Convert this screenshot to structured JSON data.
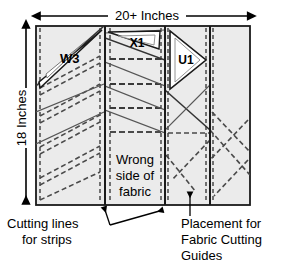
{
  "figure": {
    "kind": "fabric-cutting-layout-diagram",
    "fabric_fill": "#ebebeb",
    "fabric_stroke": "#1a1a1a",
    "guide_fill": "#ffffff",
    "dashed_stroke": "#4a4a4a",
    "diagonal_stroke": "#333333"
  },
  "dimensions": {
    "width_label": "20+ Inches",
    "height_label": "18 Inches"
  },
  "fabric": {
    "center_label_line1": "Wrong",
    "center_label_line2": "side of",
    "center_label_line3": "fabric"
  },
  "guides": [
    {
      "id": "w3",
      "label": "W3"
    },
    {
      "id": "x1",
      "label": "X1"
    },
    {
      "id": "u1",
      "label": "U1"
    }
  ],
  "callouts": {
    "cutting_lines": {
      "line1": "Cutting lines",
      "line2": "for strips"
    },
    "placement": {
      "line1": "Placement for",
      "line2": "Fabric Cutting",
      "line3": "Guides"
    }
  }
}
